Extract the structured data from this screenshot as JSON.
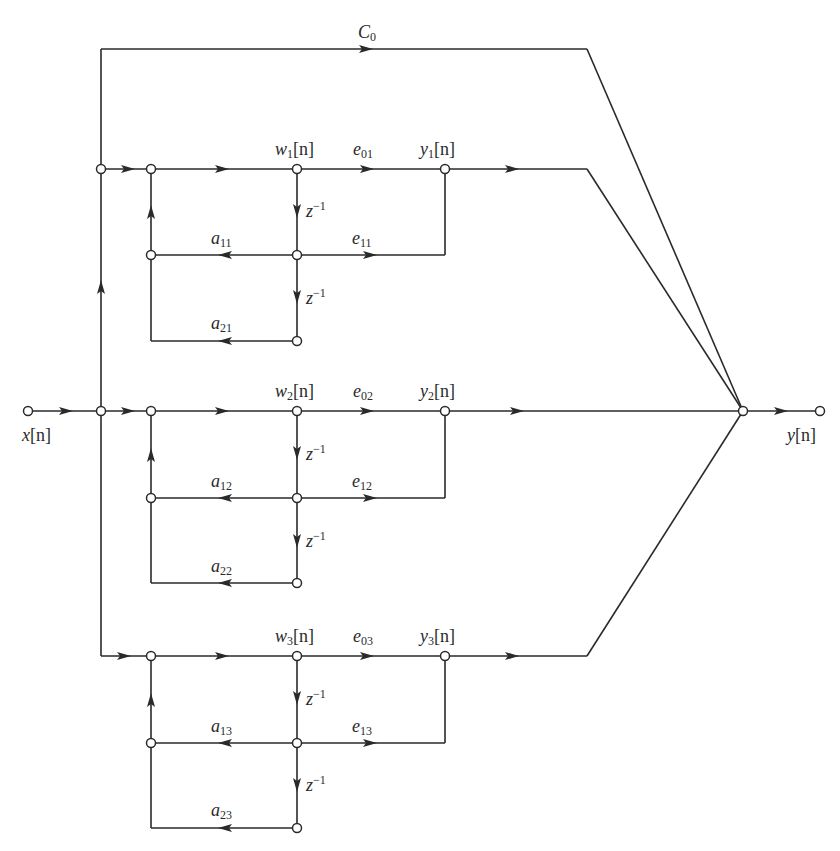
{
  "diagram": {
    "type": "parallel-form signal flow graph (three second-order sections)",
    "input": {
      "label": "x[n]",
      "base": "x",
      "sub": "",
      "arg": "[n]"
    },
    "output": {
      "label": "y[n]",
      "base": "y",
      "sub": "",
      "arg": "[n]"
    },
    "direct_path": {
      "label": "C0",
      "base": "C",
      "sub": "0"
    },
    "delay_label": {
      "base": "z",
      "sup": "−1"
    },
    "sections": [
      {
        "index": 1,
        "state": {
          "base": "w",
          "sub": "1",
          "arg": "[n]"
        },
        "output": {
          "base": "y",
          "sub": "1",
          "arg": "[n]"
        },
        "e0": {
          "base": "e",
          "sub": "01"
        },
        "e1": {
          "base": "e",
          "sub": "11"
        },
        "a1": {
          "base": "a",
          "sub": "11"
        },
        "a2": {
          "base": "a",
          "sub": "21"
        }
      },
      {
        "index": 2,
        "state": {
          "base": "w",
          "sub": "2",
          "arg": "[n]"
        },
        "output": {
          "base": "y",
          "sub": "2",
          "arg": "[n]"
        },
        "e0": {
          "base": "e",
          "sub": "02"
        },
        "e1": {
          "base": "e",
          "sub": "12"
        },
        "a1": {
          "base": "a",
          "sub": "12"
        },
        "a2": {
          "base": "a",
          "sub": "22"
        }
      },
      {
        "index": 3,
        "state": {
          "base": "w",
          "sub": "3",
          "arg": "[n]"
        },
        "output": {
          "base": "y",
          "sub": "3",
          "arg": "[n]"
        },
        "e0": {
          "base": "e",
          "sub": "03"
        },
        "e1": {
          "base": "e",
          "sub": "13"
        },
        "a1": {
          "base": "a",
          "sub": "13"
        },
        "a2": {
          "base": "a",
          "sub": "23"
        }
      }
    ]
  }
}
